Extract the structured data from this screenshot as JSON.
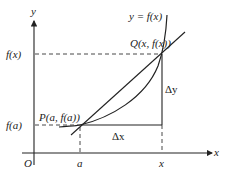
{
  "diagram": {
    "type": "secant-line-derivative",
    "axes": {
      "x_label": "x",
      "y_label": "y",
      "origin_label": "O"
    },
    "curve_label": "y = f(x)",
    "points": {
      "P": {
        "label": "P(a, f(a))"
      },
      "Q": {
        "label": "Q(x, f(x))"
      }
    },
    "tick_labels": {
      "x_a": "a",
      "x_x": "x",
      "y_fa": "f(a)",
      "y_fx": "f(x)"
    },
    "increments": {
      "dx": "Δx",
      "dy": "Δy"
    },
    "colors": {
      "line": "#222222",
      "background": "#ffffff"
    }
  }
}
